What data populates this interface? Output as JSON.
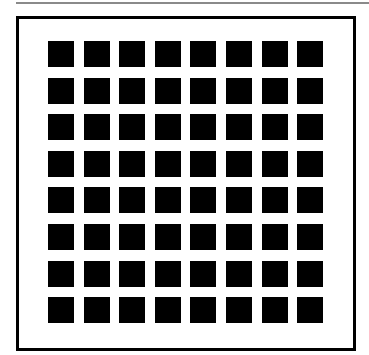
{
  "figure": {
    "type": "grid-illusion",
    "rows": 8,
    "cols": 8,
    "square_color": "#000000",
    "background_color": "#ffffff",
    "border_color": "#000000",
    "top_rule_color": "#8a8a8a"
  }
}
